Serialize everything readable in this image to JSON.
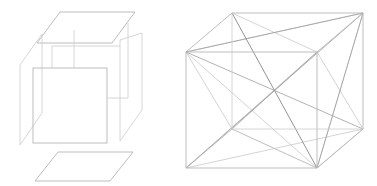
{
  "canvas": {
    "width": 377,
    "height": 186,
    "background": "#ffffff",
    "title": "Exploded cube and cube with space diagonals"
  },
  "palette": {
    "edge": "#b6b6b6",
    "edge_faint": "#cccccc",
    "diagonal": "#9a9a9a",
    "diagonal_faint": "#c2c2c2",
    "diagonal_dark": "#808080",
    "background": "#ffffff"
  },
  "figures": [
    {
      "id": "exploded-cube",
      "label": "Exploded cube",
      "description": "Wireframe cube drawn as separated planar faces: a top parallelogram, a bottom parallelogram, a left side parallelogram, a right side parallelogram, a front square, and two short vertical connector segments under the top face.",
      "parts": [
        {
          "name": "top-face",
          "shape": "parallelogram",
          "points": "60,12 135,12 112,43 37,43"
        },
        {
          "name": "bottom-face",
          "shape": "parallelogram",
          "points": "58,152 133,152 110,181 35,181"
        },
        {
          "name": "left-face",
          "shape": "parallelogram",
          "points": "42,34 20,65 20,145 42,113"
        },
        {
          "name": "right-face",
          "shape": "parallelogram",
          "points": "120,40 142,33 142,110 120,141"
        },
        {
          "name": "front-face",
          "shape": "square",
          "points": "33,68 107,68 107,143 33,143"
        },
        {
          "name": "connector-left",
          "shape": "segment",
          "points": "52,46 52,68"
        },
        {
          "name": "connector-right",
          "shape": "segment",
          "points": "74,30 74,68"
        },
        {
          "name": "connector-top-rail",
          "shape": "segment",
          "points": "52,46 120,46"
        },
        {
          "name": "connector-right-vertical",
          "shape": "segment",
          "points": "128,23 128,98"
        },
        {
          "name": "connector-right-rail",
          "shape": "segment",
          "points": "107,98 128,98"
        }
      ]
    },
    {
      "id": "diagonal-cube",
      "label": "Cube with face and space diagonals",
      "description": "A wireframe cube in oblique projection with all face diagonals and space diagonals drawn, most converging at the front-top-left vertex and the front-bottom-right vertex.",
      "vertices": {
        "front_top_left": "186,52",
        "front_top_right": "317,52",
        "front_bottom_left": "186,168",
        "front_bottom_right": "317,168",
        "back_top_left": "232,13",
        "back_top_right": "363,13",
        "back_bottom_left": "232,129",
        "back_bottom_right": "363,129"
      },
      "edges": [
        {
          "name": "front-top",
          "points": "186,52 317,52"
        },
        {
          "name": "front-right",
          "points": "317,52 317,168"
        },
        {
          "name": "front-bottom",
          "points": "186,168 317,168"
        },
        {
          "name": "front-left",
          "points": "186,52 186,168"
        },
        {
          "name": "back-top",
          "points": "232,13 363,13"
        },
        {
          "name": "back-right",
          "points": "363,13 363,129"
        },
        {
          "name": "back-bottom",
          "points": "232,129 363,129"
        },
        {
          "name": "back-left",
          "points": "232,13 232,129"
        },
        {
          "name": "connect-top-left",
          "points": "186,52 232,13"
        },
        {
          "name": "connect-top-right",
          "points": "317,52 363,13"
        },
        {
          "name": "connect-bottom-left",
          "points": "186,168 232,129"
        },
        {
          "name": "connect-bottom-right",
          "points": "317,168 363,129"
        }
      ],
      "diagonals": [
        {
          "name": "space-diagonal-ftl-to-bbr",
          "points": "186,52 363,129",
          "weight": "dark"
        },
        {
          "name": "space-diagonal-fbr-to-btl",
          "points": "317,168 232,13",
          "weight": "dark"
        },
        {
          "name": "space-diagonal-ftl-to-fbr-top",
          "points": "186,52 363,13",
          "weight": "normal"
        },
        {
          "name": "face-diagonal-top-ftl-btr",
          "points": "186,52 363,13",
          "weight": "normal"
        },
        {
          "name": "face-diagonal-ftl-to-fbr",
          "points": "186,52 317,168",
          "weight": "normal"
        },
        {
          "name": "face-diagonal-ftl-to-bbl",
          "points": "186,52 232,129",
          "weight": "normal"
        },
        {
          "name": "face-diagonal-ftl-to-fbl-right",
          "points": "186,52 317,168",
          "weight": "normal"
        },
        {
          "name": "diag-ftl-to-bbr-lower",
          "points": "186,52 363,129",
          "weight": "normal"
        },
        {
          "name": "diag-fbr-to-ftr",
          "points": "317,168 363,13",
          "weight": "normal"
        },
        {
          "name": "diag-fbr-to-btl-edge",
          "points": "317,168 232,13",
          "weight": "normal"
        },
        {
          "name": "diag-fbr-to-fbl",
          "points": "317,168 186,168",
          "weight": "faint"
        },
        {
          "name": "diag-fbr-to-ftl-long",
          "points": "317,168 186,52",
          "weight": "normal"
        },
        {
          "name": "diag-fbr-to-bbl",
          "points": "317,168 232,129",
          "weight": "faint"
        },
        {
          "name": "diag-fbr-to-bbr",
          "points": "317,168 363,129",
          "weight": "faint"
        },
        {
          "name": "diag-bottom-fbl-to-bbr",
          "points": "186,168 363,129",
          "weight": "faint"
        },
        {
          "name": "diag-top-btl-to-ftr",
          "points": "232,13 317,52",
          "weight": "faint"
        },
        {
          "name": "diag-ftr-to-bbr",
          "points": "317,52 363,129",
          "weight": "faint"
        },
        {
          "name": "diag-ftl-to-btr-space",
          "points": "186,52 363,129",
          "weight": "faint"
        }
      ]
    }
  ]
}
